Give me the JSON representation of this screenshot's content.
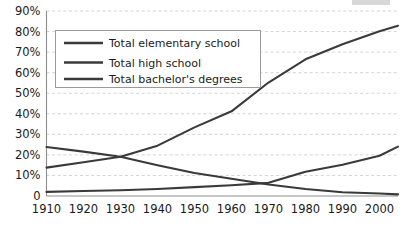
{
  "chart_data": {
    "type": "line",
    "title": "",
    "xlabel": "",
    "ylabel": "",
    "xlim": [
      1910,
      2005
    ],
    "ylim": [
      0,
      90
    ],
    "grid": true,
    "grid_axis": "y",
    "legend_position": "top-left",
    "x_tick_labels": [
      "1910",
      "1920",
      "1930",
      "1940",
      "1950",
      "1960",
      "1970",
      "1980",
      "1990",
      "2000"
    ],
    "x_ticks": [
      1910,
      1920,
      1930,
      1940,
      1950,
      1960,
      1970,
      1980,
      1990,
      2000
    ],
    "y_tick_labels": [
      "0",
      "10%",
      "20%",
      "30%",
      "40%",
      "50%",
      "60%",
      "70%",
      "80%",
      "90%"
    ],
    "y_ticks": [
      0,
      10,
      20,
      30,
      40,
      50,
      60,
      70,
      80,
      90
    ],
    "series": [
      {
        "name": "Total elementary school",
        "color": "#3a3a3a",
        "x": [
          1910,
          1920,
          1930,
          1940,
          1950,
          1960,
          1970,
          1980,
          1990,
          2000,
          2005
        ],
        "values": [
          23.8,
          21.6,
          19.1,
          15.0,
          11.2,
          8.4,
          5.6,
          3.4,
          1.8,
          1.2,
          0.8
        ]
      },
      {
        "name": "Total high school",
        "color": "#3a3a3a",
        "x": [
          1910,
          1920,
          1930,
          1940,
          1950,
          1960,
          1970,
          1980,
          1990,
          2000,
          2005
        ],
        "values": [
          13.8,
          16.4,
          19.1,
          24.5,
          33.4,
          41.2,
          55.2,
          66.5,
          73.8,
          80.2,
          82.8
        ]
      },
      {
        "name": "Total bachelor's degrees",
        "color": "#3a3a3a",
        "x": [
          1910,
          1920,
          1930,
          1940,
          1950,
          1960,
          1970,
          1980,
          1990,
          2000,
          2005
        ],
        "values": [
          2.0,
          2.4,
          2.8,
          3.4,
          4.3,
          5.2,
          6.4,
          11.8,
          15.2,
          19.6,
          24.0
        ]
      }
    ],
    "annotations": [
      {
        "label": "elementary-highschool-crossover",
        "x": 1930,
        "y": 19.1
      },
      {
        "label": "elementary-bachelors-crossover",
        "x": 1970,
        "y": 6.0
      }
    ]
  },
  "legend": {
    "items": [
      {
        "label": "Total elementary school"
      },
      {
        "label": "Total high school"
      },
      {
        "label": "Total bachelor's degrees"
      }
    ]
  }
}
